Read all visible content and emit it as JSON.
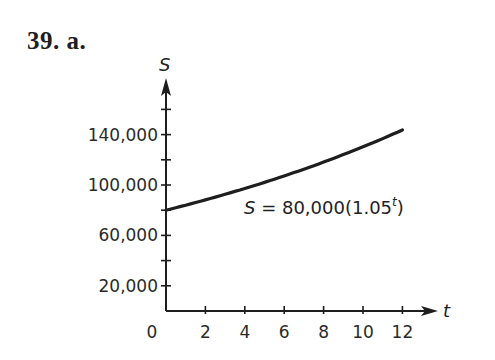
{
  "title": "39. a.",
  "equation": {
    "lhs": "S",
    "eq_sign": " = ",
    "body": "80,000(1.05",
    "exponent": "t",
    "close": ")"
  },
  "chart_data": {
    "type": "line",
    "title": "39. a.",
    "xlabel": "t",
    "ylabel": "S",
    "x_ticks": [
      0,
      2,
      4,
      6,
      8,
      10,
      12
    ],
    "x_tick_labels": [
      "0",
      "2",
      "4",
      "6",
      "8",
      "10",
      "12"
    ],
    "y_tick_labels": [
      "20,000",
      "60,000",
      "100,000",
      "140,000"
    ],
    "y_ticks_labeled": [
      20000,
      60000,
      100000,
      140000
    ],
    "y_ticks_minor": [
      40000,
      80000,
      120000,
      160000
    ],
    "xlim": [
      0,
      13.5
    ],
    "ylim": [
      0,
      165000
    ],
    "grid": false,
    "annotation": "S = 80,000(1.05^t)",
    "series": [
      {
        "name": "S = 80,000(1.05^t)",
        "x": [
          0,
          1,
          2,
          3,
          4,
          5,
          6,
          7,
          8,
          9,
          10,
          11,
          12
        ],
        "values": [
          80000,
          84000,
          88200,
          92610,
          97241,
          102103,
          107208,
          112568,
          118196,
          124106,
          130312,
          136827,
          143668
        ]
      }
    ]
  },
  "colors": {
    "ink": "#1e1e1e",
    "background": "#ffffff"
  }
}
